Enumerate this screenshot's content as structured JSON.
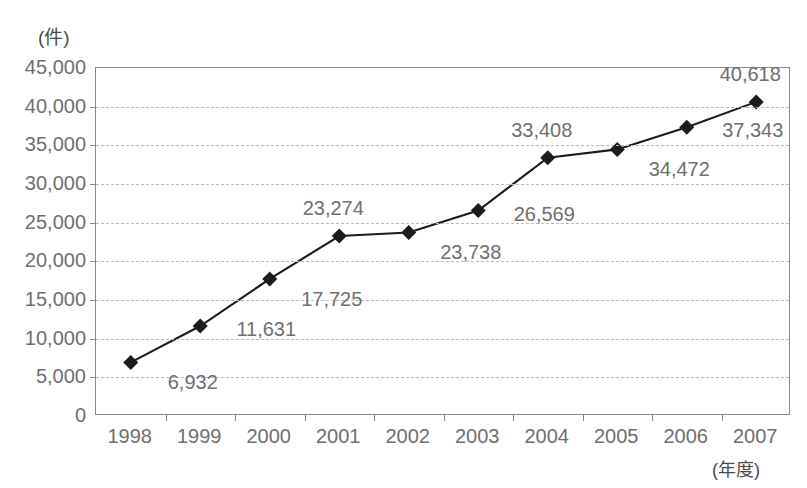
{
  "chart_data": {
    "type": "line",
    "title": "",
    "xlabel": "(年度)",
    "ylabel": "(件)",
    "categories": [
      "1998",
      "1999",
      "2000",
      "2001",
      "2002",
      "2003",
      "2004",
      "2005",
      "2006",
      "2007"
    ],
    "values": [
      6932,
      11631,
      17725,
      23274,
      23738,
      26569,
      33408,
      34472,
      37343,
      40618
    ],
    "point_labels": [
      "6,932",
      "11,631",
      "17,725",
      "23,274",
      "23,738",
      "26,569",
      "33,408",
      "34,472",
      "37,343",
      "40,618"
    ],
    "label_positions": [
      "below-right",
      "right",
      "below-right",
      "above",
      "below-right",
      "right",
      "above",
      "below-right",
      "right",
      "above"
    ],
    "ylim": [
      0,
      45000
    ],
    "ytick_values": [
      45000,
      40000,
      35000,
      30000,
      25000,
      20000,
      15000,
      10000,
      5000,
      0
    ],
    "ytick_labels": [
      "45,000",
      "40,000",
      "35,000",
      "30,000",
      "25,000",
      "20,000",
      "15,000",
      "10,000",
      "5,000",
      "0"
    ],
    "grid": "horizontal-dashed",
    "legend": "none",
    "marker": "diamond",
    "marker_color": "#1c1c1c",
    "line_color": "#1c1c1c",
    "grid_color": "#b9b9b9",
    "axis_color": "#8a8a8a",
    "text_color": "#6f6f6f"
  }
}
